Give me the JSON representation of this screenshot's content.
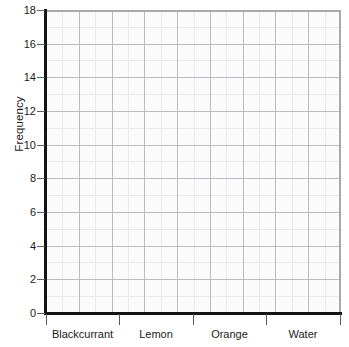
{
  "chart_data": {
    "type": "bar",
    "title": "",
    "subtitle": "",
    "xlabel": "",
    "ylabel": "Frequency",
    "categories": [
      "Blackcurrant",
      "Lemon",
      "Orange",
      "Water"
    ],
    "values": [
      null,
      null,
      null,
      null
    ],
    "series": [
      {
        "name": "Frequency",
        "values": [
          null,
          null,
          null,
          null
        ]
      }
    ],
    "ylim": [
      0,
      18
    ],
    "y_ticks": [
      0,
      2,
      4,
      6,
      8,
      10,
      12,
      14,
      16,
      18
    ],
    "y_tick_labels": [
      "0",
      "2",
      "4",
      "6",
      "8",
      "10",
      "12",
      "14",
      "16",
      "18"
    ],
    "grid": true,
    "grid_minor": true,
    "legend": false,
    "legend_position": "none",
    "annotations": [],
    "note": "Empty plotting grid - no bars drawn"
  },
  "axes": {
    "y_title": "Frequency",
    "y_tick_labels": [
      "18",
      "16",
      "14",
      "12",
      "10",
      "8",
      "6",
      "4",
      "2",
      "0"
    ],
    "x_category_labels": [
      "Blackcurrant",
      "Lemon",
      "Orange",
      "Water"
    ]
  },
  "colors": {
    "axis": "#141414",
    "major_grid": "#b9bcc0",
    "minor_grid": "#e9eaec",
    "plot_background": "#fbfbfb",
    "page_background": "#ffffff",
    "text": "#1a1a1a"
  }
}
